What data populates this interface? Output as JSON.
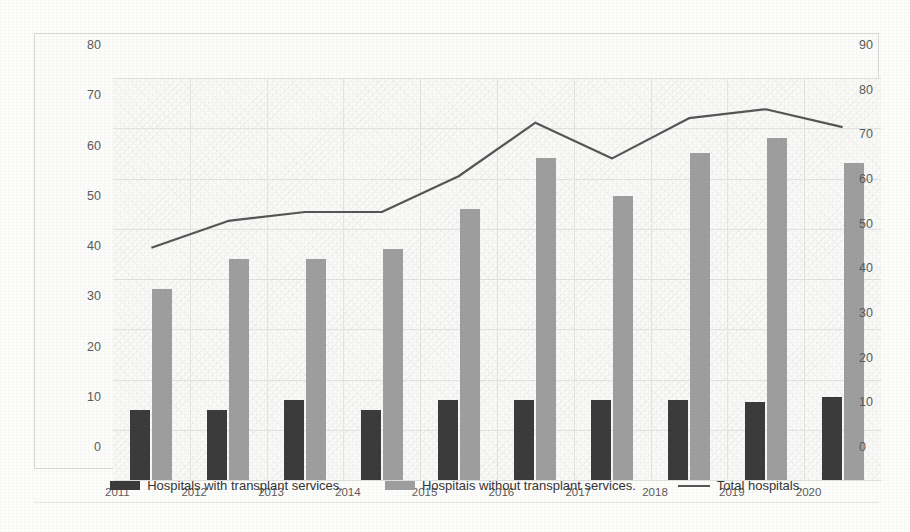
{
  "chart_data": {
    "type": "bar",
    "title": "",
    "subtitle": "",
    "xlabel": "",
    "ylabel": "",
    "categories": [
      "2011",
      "2012",
      "2013",
      "2014",
      "2015",
      "2016",
      "2017",
      "2018",
      "2019",
      "2020"
    ],
    "series": [
      {
        "name": "Hospitals with transplant services.",
        "type": "bar",
        "axis": "left",
        "color": "#3a3a3a",
        "values": [
          14,
          14,
          16,
          14,
          16,
          16,
          16,
          16,
          15.5,
          16.5
        ]
      },
      {
        "name": "Hospitais without transplant services.",
        "type": "bar",
        "axis": "left",
        "color": "#9e9e9e",
        "values": [
          38,
          44,
          44,
          46,
          54,
          64,
          56.5,
          65,
          68,
          63
        ]
      },
      {
        "name": "Total hospitals.",
        "type": "line",
        "axis": "right",
        "color": "#555555",
        "values": [
          52,
          58,
          60,
          60,
          68,
          80,
          72,
          81,
          83,
          79
        ]
      }
    ],
    "left_axis": {
      "ylim": [
        0,
        80
      ],
      "tick_step": 10,
      "ticks": [
        "0",
        "10",
        "20",
        "30",
        "40",
        "50",
        "60",
        "70",
        "80"
      ]
    },
    "right_axis": {
      "ylim": [
        0,
        90
      ],
      "tick_step": 10,
      "ticks": [
        "0",
        "10",
        "20",
        "30",
        "40",
        "50",
        "60",
        "70",
        "80",
        "90"
      ]
    },
    "grid": true,
    "legend_position": "bottom"
  },
  "legend": {
    "items": [
      {
        "label": "Hospitals with transplant services.",
        "marker": "bar-dark-swatch"
      },
      {
        "label": "Hospitais without transplant services.",
        "marker": "bar-gray-swatch"
      },
      {
        "label": "Total hospitals.",
        "marker": "line-swatch"
      }
    ]
  },
  "colors": {
    "series_dark": "#3a3a3a",
    "series_gray": "#9e9e9e",
    "line": "#555555",
    "grid": "#e2e2e0",
    "background": "#fcfcfb"
  }
}
